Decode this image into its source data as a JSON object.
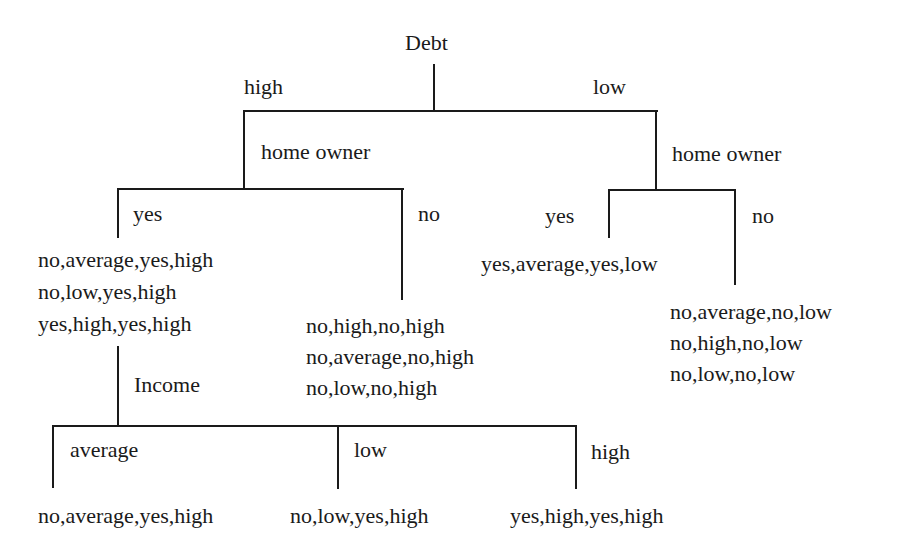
{
  "diagram": {
    "type": "decision-tree",
    "root": {
      "attribute": "Debt",
      "branches": {
        "high": {
          "label": "high",
          "attribute": "home owner",
          "branches": {
            "yes": {
              "label": "yes",
              "examples": [
                "no,average,yes,high",
                "no,low,yes,high",
                "yes,high,yes,high"
              ],
              "attribute": "Income",
              "branches": {
                "average": {
                  "label": "average",
                  "examples": [
                    "no,average,yes,high"
                  ]
                },
                "low": {
                  "label": "low",
                  "examples": [
                    "no,low,yes,high"
                  ]
                },
                "high": {
                  "label": "high",
                  "examples": [
                    "yes,high,yes,high"
                  ]
                }
              }
            },
            "no": {
              "label": "no",
              "examples": [
                "no,high,no,high",
                "no,average,no,high",
                "no,low,no,high"
              ]
            }
          }
        },
        "low": {
          "label": "low",
          "attribute": "home owner",
          "branches": {
            "yes": {
              "label": "yes",
              "examples": [
                "yes,average,yes,low"
              ]
            },
            "no": {
              "label": "no",
              "examples": [
                "no,average,no,low",
                "no,high,no,low",
                "no,low,no,low"
              ]
            }
          }
        }
      }
    }
  },
  "colors": {
    "line": "#1a1a1a",
    "text": "#1a1a1a",
    "background": "#ffffff"
  }
}
